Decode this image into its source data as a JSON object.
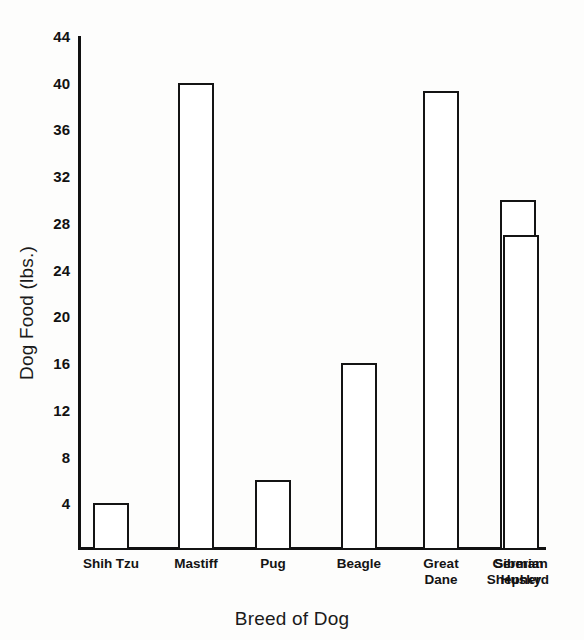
{
  "chart_data": {
    "type": "bar",
    "title": "",
    "xlabel": "Breed of Dog",
    "ylabel": "Dog Food (lbs.)",
    "categories": [
      "Shih Tzu",
      "Mastiff",
      "Pug",
      "Beagle",
      "Great Dane",
      "German Shepherd",
      "Siberian Husky"
    ],
    "category_lines": [
      [
        "Shih Tzu"
      ],
      [
        "Mastiff"
      ],
      [
        "Pug"
      ],
      [
        "Beagle"
      ],
      [
        "Great",
        "Dane"
      ],
      [
        "German",
        "Shepherd"
      ],
      [
        "Siberian",
        "Husky"
      ]
    ],
    "values": [
      4,
      40,
      6,
      16,
      39.3,
      30,
      27
    ],
    "ylim": [
      0,
      44
    ],
    "yticks": [
      4,
      8,
      12,
      16,
      20,
      24,
      28,
      32,
      36,
      40,
      44
    ],
    "ytick_labels": [
      "4",
      "8",
      "12",
      "16",
      "20",
      "24",
      "28",
      "32",
      "36",
      "40",
      "44"
    ],
    "grid": false,
    "legend": null,
    "bar_style": {
      "fill": "#ffffff",
      "edge": "#141414",
      "edge_width": 2.5
    },
    "background": "#fdfdfc"
  }
}
